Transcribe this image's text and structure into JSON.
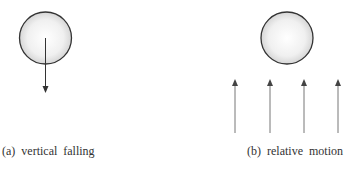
{
  "panels": [
    {
      "id": "a",
      "caption": "(a)  vertical  falling",
      "sphere": {
        "cx": 45.5,
        "cy": 38,
        "r": 26
      },
      "arrows": [
        {
          "x": 45.5,
          "y1": 38,
          "y2": 93,
          "direction": "down"
        }
      ]
    },
    {
      "id": "b",
      "caption": "(b)  relative  motion",
      "sphere": {
        "cx": 287,
        "cy": 38,
        "r": 26
      },
      "arrows": [
        {
          "x": 235,
          "y1": 133,
          "y2": 79,
          "direction": "up"
        },
        {
          "x": 270,
          "y1": 133,
          "y2": 79,
          "direction": "up"
        },
        {
          "x": 304,
          "y1": 133,
          "y2": 79,
          "direction": "up"
        },
        {
          "x": 338,
          "y1": 133,
          "y2": 79,
          "direction": "up"
        }
      ]
    }
  ],
  "colors": {
    "outline": "#333333",
    "arrow_a": "#333333",
    "arrow_b": "#666666",
    "fill_center": "#ffffff",
    "fill_edge": "#d8d8d8"
  }
}
